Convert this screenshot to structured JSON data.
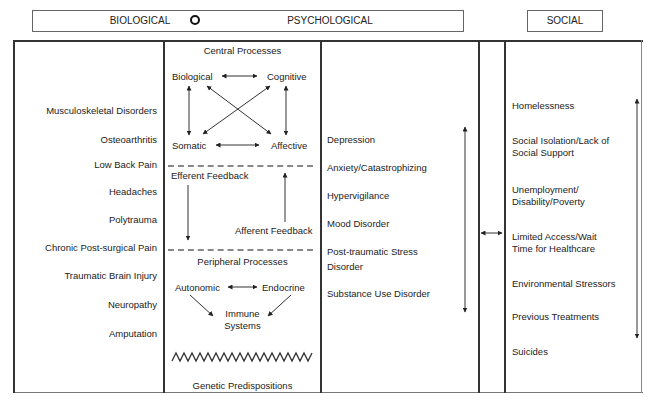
{
  "header": {
    "biological": "BIOLOGICAL",
    "psychological": "PSYCHOLOGICAL",
    "social": "SOCIAL"
  },
  "biological_conditions": [
    "Musculoskeletal Disorders",
    "Osteoarthritis",
    "Low Back Pain",
    "Headaches",
    "Polytrauma",
    "Chronic Post-surgical Pain",
    "Traumatic Brain Injury",
    "Neuropathy",
    "Amputation"
  ],
  "processes": {
    "central_title": "Central Processes",
    "biological": "Biological",
    "cognitive": "Cognitive",
    "somatic": "Somatic",
    "affective": "Affective",
    "efferent": "Efferent Feedback",
    "afferent": "Afferent Feedback",
    "peripheral_title": "Peripheral Processes",
    "autonomic": "Autonomic",
    "endocrine": "Endocrine",
    "immune_line1": "Immune",
    "immune_line2": "Systems",
    "genetic": "Genetic Predispositions"
  },
  "psychological_conditions": [
    "Depression",
    "Anxiety/Catastrophizing",
    "Hypervigilance",
    "Mood Disorder",
    "Post-traumatic Stress",
    "Disorder",
    "Substance Use Disorder"
  ],
  "social_factors": [
    "Homelessness",
    "Social Isolation/Lack of",
    "Social Support",
    "Unemployment/",
    "Disability/Poverty",
    "Limited Access/Wait",
    "Time for Healthcare",
    "Environmental Stressors",
    "Previous Treatments",
    "Suicides"
  ]
}
